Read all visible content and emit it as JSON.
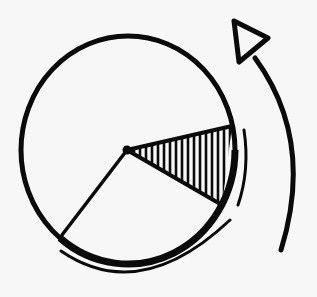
{
  "figure": {
    "background": "#f7f7f7",
    "ink": "#0a0a0a",
    "circle": {
      "cx": 128,
      "cy": 150,
      "rx": 107,
      "ry": 114
    },
    "center_dot": {
      "cx": 127,
      "cy": 150,
      "r": 4
    },
    "wedge": {
      "apex": [
        127,
        150
      ],
      "top": [
        232,
        126
      ],
      "bottom": [
        222,
        205
      ],
      "hatch_count": 16
    },
    "radius_line": {
      "from": [
        127,
        150
      ],
      "to": [
        62,
        235
      ]
    },
    "arrowhead": {
      "points": [
        [
          234,
          21
        ],
        [
          268,
          38
        ],
        [
          239,
          62
        ]
      ]
    }
  }
}
